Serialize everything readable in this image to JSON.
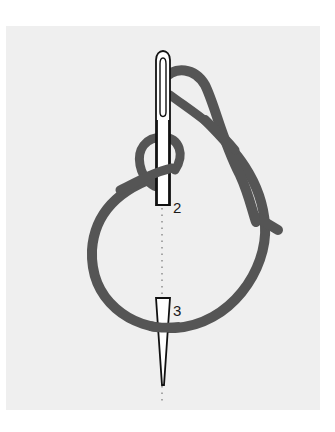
{
  "figure": {
    "labels": {
      "point_2": "2",
      "point_3": "3"
    },
    "colors": {
      "background": "#ffffff",
      "panel": "#efefef",
      "thread": "#555555",
      "needle_outline": "#111111",
      "needle_fill": "#ffffff"
    }
  }
}
